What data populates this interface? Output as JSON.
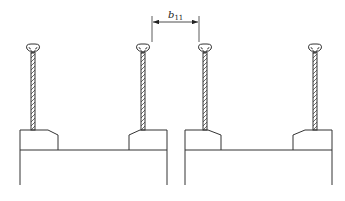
{
  "diagram": {
    "type": "cross-section engineering drawing",
    "dimension": {
      "label_main": "b",
      "label_sub": "11"
    },
    "elements": [
      {
        "name": "stud-1",
        "x": 33
      },
      {
        "name": "stud-2",
        "x": 143
      },
      {
        "name": "stud-3",
        "x": 205
      },
      {
        "name": "stud-4",
        "x": 315
      }
    ],
    "supports": [
      {
        "name": "left-beam",
        "x_left": 20,
        "x_right": 167
      },
      {
        "name": "right-beam",
        "x_left": 185,
        "x_right": 332
      }
    ],
    "colors": {
      "line": "#333333",
      "background": "#ffffff"
    }
  }
}
